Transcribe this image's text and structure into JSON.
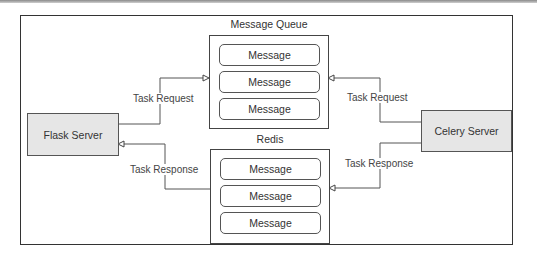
{
  "diagram": {
    "nodes": {
      "flask": {
        "label": "Flask Server",
        "fill": "#e6e6e6"
      },
      "celery": {
        "label": "Celery Server",
        "fill": "#e6e6e6"
      }
    },
    "message_queue": {
      "title": "Message Queue",
      "messages": [
        "Message",
        "Message",
        "Message"
      ]
    },
    "redis": {
      "title": "Redis",
      "messages": [
        "Message",
        "Message",
        "Message"
      ]
    },
    "edges": [
      {
        "from": "Flask Server",
        "to": "Message Queue",
        "label": "Task Request"
      },
      {
        "from": "Celery Server",
        "to": "Message Queue",
        "label": "Task Request"
      },
      {
        "from": "Redis",
        "to": "Flask Server",
        "label": "Task Response"
      },
      {
        "from": "Celery Server",
        "to": "Redis",
        "label": "Task Response"
      }
    ]
  }
}
